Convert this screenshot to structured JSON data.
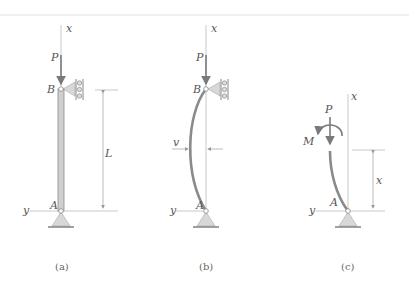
{
  "figure": {
    "top_rule": true,
    "colors": {
      "member": "#8a8a8a",
      "member_fill": "#cfcfcf",
      "axis": "#b8b8b8",
      "support_fill": "#d8d8d8",
      "text": "#555555"
    },
    "panels": [
      {
        "id": "a",
        "caption": "(a)",
        "labels": {
          "x_axis": "x",
          "y_axis": "y",
          "load": "P",
          "top_pin": "B",
          "bottom_pin": "A",
          "length": "L"
        },
        "description": "Straight pin-supported column of length L with axial load P at B"
      },
      {
        "id": "b",
        "caption": "(b)",
        "labels": {
          "x_axis": "x",
          "y_axis": "y",
          "load": "P",
          "top_pin": "B",
          "bottom_pin": "A",
          "deflection": "v"
        },
        "description": "Buckled column with lateral deflection v"
      },
      {
        "id": "c",
        "caption": "(c)",
        "labels": {
          "x_axis": "x",
          "y_axis": "y",
          "load": "P",
          "moment": "M",
          "bottom_pin": "A",
          "section_height": "x"
        },
        "description": "Free-body segment of deflected column at height x with internal P and M"
      }
    ]
  }
}
